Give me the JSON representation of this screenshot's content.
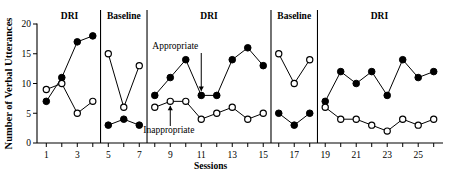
{
  "chart_data": {
    "type": "line",
    "title": "",
    "xlabel": "Sessions",
    "ylabel": "Number of Verbal Utterances",
    "ylim": [
      0,
      20
    ],
    "xlim": [
      0.4,
      26.6
    ],
    "ytick_labels": [
      "0",
      "5",
      "10",
      "15",
      "20"
    ],
    "ytick_values": [
      0,
      5,
      10,
      15,
      20
    ],
    "xtick_values": [
      1,
      2,
      3,
      4,
      5,
      6,
      7,
      8,
      9,
      10,
      11,
      12,
      13,
      14,
      15,
      16,
      17,
      18,
      19,
      20,
      21,
      22,
      23,
      24,
      25,
      26
    ],
    "xtick_labels": [
      "1",
      "3",
      "5",
      "7",
      "9",
      "11",
      "13",
      "15",
      "17",
      "19",
      "21",
      "23",
      "25"
    ],
    "xtick_label_values": [
      1,
      3,
      5,
      7,
      9,
      11,
      13,
      15,
      17,
      19,
      21,
      23,
      25
    ],
    "grid": false,
    "legend_position": "inline-annotation",
    "phases": [
      {
        "label": "DRI",
        "start": 1,
        "end": 4
      },
      {
        "label": "Baseline",
        "start": 5,
        "end": 7
      },
      {
        "label": "DRI",
        "start": 8,
        "end": 15
      },
      {
        "label": "Baseline",
        "start": 16,
        "end": 18
      },
      {
        "label": "DRI",
        "start": 19,
        "end": 26
      }
    ],
    "phase_divider_x": [
      4.5,
      7.5,
      15.5,
      18.5
    ],
    "series": [
      {
        "name": "Appropriate",
        "marker": "filled-circle",
        "x": [
          1,
          2,
          3,
          4,
          5,
          6,
          7,
          8,
          9,
          10,
          11,
          12,
          13,
          14,
          15,
          16,
          17,
          18,
          19,
          20,
          21,
          22,
          23,
          24,
          25,
          26
        ],
        "values": [
          7,
          11,
          17,
          18,
          3,
          4,
          3,
          8,
          11,
          14,
          8,
          8,
          14,
          16,
          13,
          5,
          3,
          5,
          7,
          12,
          10,
          12,
          8,
          14,
          11,
          12
        ]
      },
      {
        "name": "Inappropriate",
        "marker": "open-circle",
        "x": [
          1,
          2,
          3,
          4,
          5,
          6,
          7,
          8,
          9,
          10,
          11,
          12,
          13,
          14,
          15,
          16,
          17,
          18,
          19,
          20,
          21,
          22,
          23,
          24,
          25,
          26
        ],
        "values": [
          9,
          10,
          5,
          7,
          15,
          6,
          13,
          6,
          7,
          7,
          4,
          5,
          6,
          4,
          5,
          15,
          10,
          14,
          6,
          4,
          4,
          3,
          2,
          4,
          3,
          4
        ]
      }
    ],
    "annotations": [
      {
        "text": "Appropriate",
        "target_series": "Appropriate",
        "target_x": 11,
        "arrow": "down"
      },
      {
        "text": "Inappropriate",
        "target_series": "Inappropriate",
        "target_x": 9,
        "arrow": "up"
      }
    ]
  }
}
